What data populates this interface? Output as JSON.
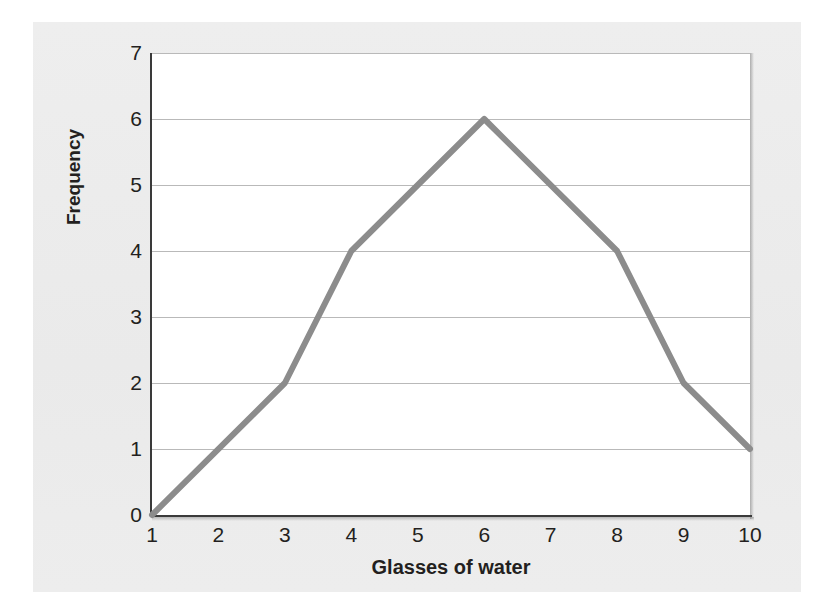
{
  "chart_data": {
    "type": "line",
    "title": "",
    "xlabel": "Glasses of water",
    "ylabel": "Frequency",
    "x": [
      1,
      3,
      4,
      6,
      8,
      9,
      10
    ],
    "values": [
      0,
      2,
      4,
      6,
      4,
      2,
      1
    ],
    "points": [
      {
        "x": 1,
        "y": 0
      },
      {
        "x": 3,
        "y": 2
      },
      {
        "x": 4,
        "y": 4
      },
      {
        "x": 6,
        "y": 6
      },
      {
        "x": 8,
        "y": 4
      },
      {
        "x": 9,
        "y": 2
      },
      {
        "x": 10,
        "y": 1
      }
    ],
    "xlim": [
      1,
      10
    ],
    "ylim": [
      0,
      7
    ],
    "xticks": [
      1,
      2,
      3,
      4,
      5,
      6,
      7,
      8,
      9,
      10
    ],
    "yticks": [
      0,
      1,
      2,
      3,
      4,
      5,
      6,
      7
    ],
    "xtick_labels": [
      "1",
      "2",
      "3",
      "4",
      "5",
      "6",
      "7",
      "8",
      "9",
      "10"
    ],
    "ytick_labels": [
      "0",
      "1",
      "2",
      "3",
      "4",
      "5",
      "6",
      "7"
    ],
    "grid": "horizontal",
    "legend": "none",
    "series_color": "#8c8c8c",
    "gridline_color": "#b9b9b9",
    "axis_color": "#3a3a3a",
    "plot_background": "#ffffff",
    "panel_background": "#ebebeb",
    "text_color": "#231f20"
  }
}
